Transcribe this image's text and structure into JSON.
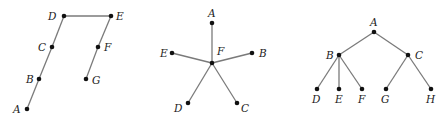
{
  "colors": {
    "edge": "#7a7a7a",
    "node": "#111111",
    "label": "#222222",
    "background": "#ffffff"
  },
  "graphs": [
    {
      "name": "path-graph",
      "nodes": [
        {
          "id": "A",
          "x": 27,
          "y": 109,
          "lx": 13,
          "ly": 113
        },
        {
          "id": "B",
          "x": 39,
          "y": 79,
          "lx": 26,
          "ly": 83
        },
        {
          "id": "C",
          "x": 52,
          "y": 47,
          "lx": 38,
          "ly": 51
        },
        {
          "id": "D",
          "x": 64,
          "y": 16,
          "lx": 48,
          "ly": 20
        },
        {
          "id": "E",
          "x": 111,
          "y": 16,
          "lx": 116,
          "ly": 20
        },
        {
          "id": "F",
          "x": 98,
          "y": 47,
          "lx": 104,
          "ly": 51
        },
        {
          "id": "G",
          "x": 86,
          "y": 79,
          "lx": 92,
          "ly": 84
        }
      ],
      "edges": [
        [
          "A",
          "B"
        ],
        [
          "B",
          "C"
        ],
        [
          "C",
          "D"
        ],
        [
          "D",
          "E"
        ],
        [
          "E",
          "F"
        ],
        [
          "F",
          "G"
        ]
      ]
    },
    {
      "name": "star-graph",
      "nodes": [
        {
          "id": "A",
          "x": 212,
          "y": 23,
          "lx": 208,
          "ly": 17
        },
        {
          "id": "B",
          "x": 252,
          "y": 53,
          "lx": 259,
          "ly": 57
        },
        {
          "id": "C",
          "x": 237,
          "y": 103,
          "lx": 241,
          "ly": 112
        },
        {
          "id": "D",
          "x": 188,
          "y": 103,
          "lx": 174,
          "ly": 112
        },
        {
          "id": "E",
          "x": 172,
          "y": 53,
          "lx": 160,
          "ly": 57
        },
        {
          "id": "F",
          "x": 212,
          "y": 63,
          "lx": 217,
          "ly": 55
        }
      ],
      "edges": [
        [
          "F",
          "A"
        ],
        [
          "F",
          "B"
        ],
        [
          "F",
          "C"
        ],
        [
          "F",
          "D"
        ],
        [
          "F",
          "E"
        ]
      ]
    },
    {
      "name": "binary-tree",
      "nodes": [
        {
          "id": "A",
          "x": 374,
          "y": 32,
          "lx": 370,
          "ly": 26
        },
        {
          "id": "B",
          "x": 339,
          "y": 55,
          "lx": 326,
          "ly": 59
        },
        {
          "id": "C",
          "x": 408,
          "y": 55,
          "lx": 415,
          "ly": 59
        },
        {
          "id": "D",
          "x": 317,
          "y": 89,
          "lx": 312,
          "ly": 103
        },
        {
          "id": "E",
          "x": 339,
          "y": 89,
          "lx": 335,
          "ly": 103
        },
        {
          "id": "F",
          "x": 362,
          "y": 89,
          "lx": 358,
          "ly": 103
        },
        {
          "id": "G",
          "x": 386,
          "y": 89,
          "lx": 381,
          "ly": 103
        },
        {
          "id": "H",
          "x": 431,
          "y": 89,
          "lx": 426,
          "ly": 103
        }
      ],
      "edges": [
        [
          "A",
          "B"
        ],
        [
          "A",
          "C"
        ],
        [
          "B",
          "D"
        ],
        [
          "B",
          "E"
        ],
        [
          "B",
          "F"
        ],
        [
          "C",
          "G"
        ],
        [
          "C",
          "H"
        ]
      ]
    }
  ]
}
